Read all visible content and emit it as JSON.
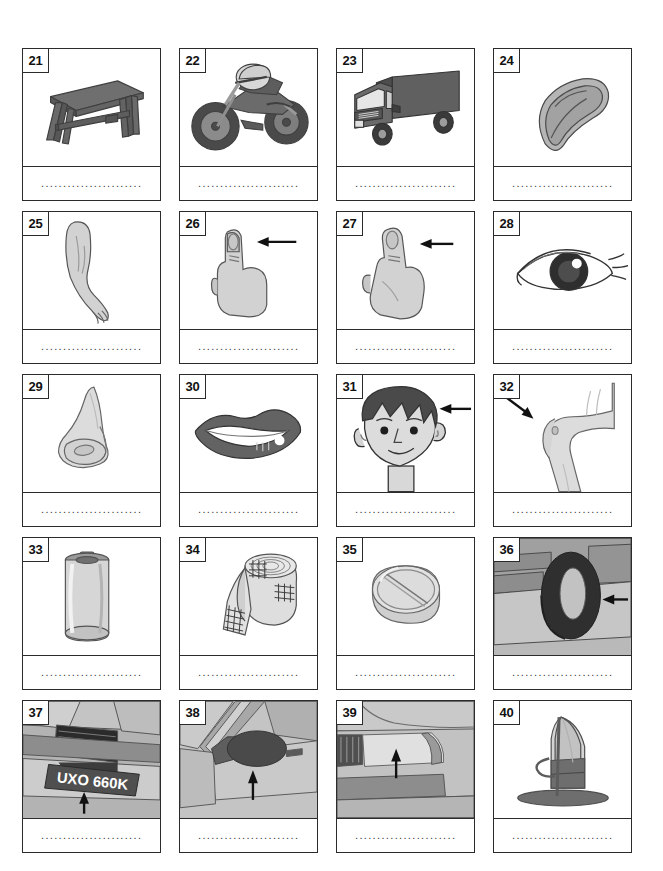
{
  "worksheet": {
    "title": "Picture vocabulary worksheet, items 21-40",
    "columns": 4,
    "rows": 5,
    "answer_line_text": "........................",
    "colors": {
      "border": "#2b2b2b",
      "ink_dark": "#555555",
      "ink_mid": "#8d8d8d",
      "ink_light": "#c9c9c9",
      "grey_bg": "#b9b9b9",
      "arrow": "#111111",
      "white": "#ffffff"
    }
  },
  "cards": [
    {
      "number": "21",
      "subject": "bench",
      "icon": "bench-icon",
      "background": "white",
      "arrow": "none"
    },
    {
      "number": "22",
      "subject": "motorbike",
      "icon": "motorbike-icon",
      "background": "white",
      "arrow": "none"
    },
    {
      "number": "23",
      "subject": "lorry",
      "icon": "lorry-icon",
      "background": "white",
      "arrow": "none"
    },
    {
      "number": "24",
      "subject": "flip-flop",
      "icon": "flip-flop-icon",
      "background": "white",
      "arrow": "none"
    },
    {
      "number": "25",
      "subject": "arm",
      "icon": "arm-icon",
      "background": "white",
      "arrow": "none"
    },
    {
      "number": "26",
      "subject": "finger",
      "icon": "finger-icon",
      "background": "white",
      "arrow": "left"
    },
    {
      "number": "27",
      "subject": "thumb",
      "icon": "thumb-icon",
      "background": "white",
      "arrow": "left"
    },
    {
      "number": "28",
      "subject": "eye",
      "icon": "eye-icon",
      "background": "white",
      "arrow": "none"
    },
    {
      "number": "29",
      "subject": "nose",
      "icon": "nose-icon",
      "background": "white",
      "arrow": "none"
    },
    {
      "number": "30",
      "subject": "mouth",
      "icon": "mouth-icon",
      "background": "white",
      "arrow": "none"
    },
    {
      "number": "31",
      "subject": "hair",
      "icon": "head-icon",
      "background": "white",
      "arrow": "left"
    },
    {
      "number": "32",
      "subject": "knee",
      "icon": "knee-icon",
      "background": "white",
      "arrow": "down-right"
    },
    {
      "number": "33",
      "subject": "battery",
      "icon": "battery-icon",
      "background": "white",
      "arrow": "none"
    },
    {
      "number": "34",
      "subject": "bandage",
      "icon": "bandage-icon",
      "background": "white",
      "arrow": "none"
    },
    {
      "number": "35",
      "subject": "tablet",
      "icon": "tablet-icon",
      "background": "white",
      "arrow": "none"
    },
    {
      "number": "36",
      "subject": "tyre",
      "icon": "tyre-icon",
      "background": "grey",
      "arrow": "left"
    },
    {
      "number": "37",
      "subject": "number-plate",
      "icon": "number-plate-icon",
      "background": "grey",
      "arrow": "up",
      "plate_text": "UXO 660K"
    },
    {
      "number": "38",
      "subject": "wing-mirror",
      "icon": "wing-mirror-icon",
      "background": "grey",
      "arrow": "up"
    },
    {
      "number": "39",
      "subject": "headlight",
      "icon": "headlight-icon",
      "background": "grey",
      "arrow": "up"
    },
    {
      "number": "40",
      "subject": "sailboard",
      "icon": "sailboard-icon",
      "background": "white",
      "arrow": "none"
    }
  ]
}
